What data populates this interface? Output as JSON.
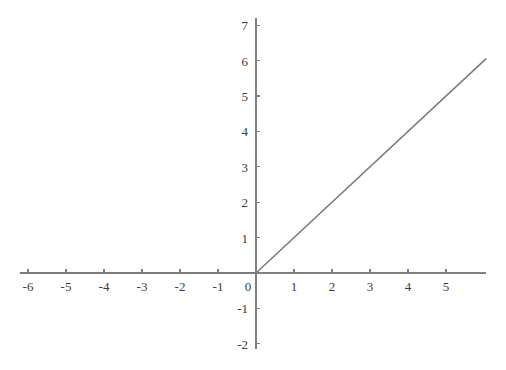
{
  "figure": {
    "background_color": "#ffffff",
    "axis_color": "#808080",
    "curve_color": "#7a7a7a",
    "label_color": "#3b3b3b",
    "origin_label": "0"
  },
  "chart_data": {
    "type": "line",
    "title": "",
    "subtitle": "",
    "xlabel": "",
    "ylabel": "",
    "xlim": [
      -6.2,
      6.05
    ],
    "ylim": [
      -2.15,
      7.2
    ],
    "grid": false,
    "legend": null,
    "legend_position": "none",
    "annotations": [],
    "x_tick_labels": [
      "-6",
      "-5",
      "-4",
      "-3",
      "-2",
      "-1",
      "0",
      "1",
      "2",
      "3",
      "4",
      "5"
    ],
    "x_tick_values": [
      -6,
      -5,
      -4,
      -3,
      -2,
      -1,
      0,
      1,
      2,
      3,
      4,
      5
    ],
    "y_tick_labels": [
      "7",
      "6",
      "5",
      "4",
      "3",
      "2",
      "1",
      "0",
      "-1",
      "-2"
    ],
    "y_tick_values": [
      7,
      6,
      5,
      4,
      3,
      2,
      1,
      0,
      -1,
      -2
    ],
    "series": [
      {
        "name": "y = max(0, x)",
        "x": [
          -6.2,
          0,
          6.05
        ],
        "values": [
          0,
          0,
          6.05
        ]
      }
    ]
  }
}
